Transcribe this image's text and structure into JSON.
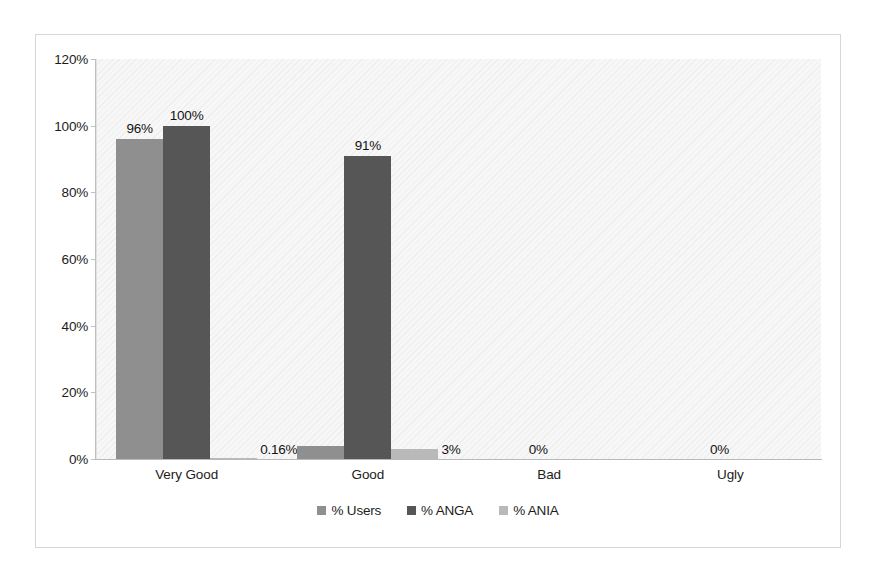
{
  "chart_data": {
    "type": "bar",
    "title": "",
    "subtitle": "",
    "xlabel": "",
    "ylabel": "",
    "categories": [
      "Very Good",
      "Good",
      "Bad",
      "Ugly"
    ],
    "series": [
      {
        "name": "% Users",
        "color": "#8f8f8f",
        "values": [
          96,
          4,
          0,
          0
        ],
        "labels": [
          "96%",
          "4%",
          "0%",
          "0%"
        ]
      },
      {
        "name": "% ANGA",
        "color": "#565656",
        "values": [
          100,
          91,
          0,
          0
        ],
        "labels": [
          "100%",
          "91%",
          "",
          ""
        ]
      },
      {
        "name": "% ANIA",
        "color": "#b9b9b9",
        "values": [
          0.16,
          3,
          0,
          0
        ],
        "labels": [
          "0.16%",
          "3%",
          "",
          ""
        ]
      }
    ],
    "ylim": [
      0,
      120
    ],
    "ytick_values": [
      0,
      20,
      40,
      60,
      80,
      100,
      120
    ],
    "ytick_labels": [
      "0%",
      "20%",
      "40%",
      "60%",
      "80%",
      "100%",
      "120%"
    ],
    "grid": false,
    "legend_position": "bottom",
    "plot_background": "#f7f7f7",
    "frame_border_color": "#d7d7d7"
  }
}
